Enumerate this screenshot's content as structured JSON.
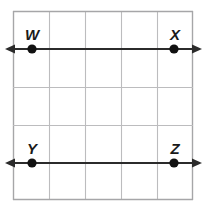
{
  "figure": {
    "name": "geometry-grid-parallel-lines",
    "background_color": "#ffffff",
    "grid": {
      "columns": 5,
      "rows": 5,
      "left": 13,
      "top": 11,
      "right": 193,
      "bottom": 200,
      "cell_width": 36,
      "cell_height": 37.8,
      "line_color": "#b9b9bb",
      "border_color": "#a6a6a8",
      "line_width": 1
    },
    "lines": [
      {
        "id": "line-WX",
        "label": "WX",
        "y": 49,
        "x_start": 6,
        "x_end": 201,
        "color": "#2b2b2b",
        "width": 2,
        "arrow_start": true,
        "arrow_end": true
      },
      {
        "id": "line-YZ",
        "label": "YZ",
        "y": 163,
        "x_start": 6,
        "x_end": 201,
        "color": "#2b2b2b",
        "width": 2,
        "arrow_start": true,
        "arrow_end": true
      }
    ],
    "points": [
      {
        "id": "point-W",
        "label": "W",
        "x": 32,
        "y": 49,
        "radius": 4.5,
        "color": "#111111",
        "label_x": 32,
        "label_y": 39,
        "label_anchor": "middle"
      },
      {
        "id": "point-X",
        "label": "X",
        "x": 174,
        "y": 49,
        "radius": 4.5,
        "color": "#111111",
        "label_x": 174,
        "label_y": 39,
        "label_anchor": "middle"
      },
      {
        "id": "point-Y",
        "label": "Y",
        "x": 32,
        "y": 163,
        "radius": 4.5,
        "color": "#111111",
        "label_x": 32,
        "label_y": 153,
        "label_anchor": "middle"
      },
      {
        "id": "point-Z",
        "label": "Z",
        "x": 174,
        "y": 163,
        "radius": 4.5,
        "color": "#111111",
        "label_x": 174,
        "label_y": 153,
        "label_anchor": "middle"
      }
    ]
  }
}
